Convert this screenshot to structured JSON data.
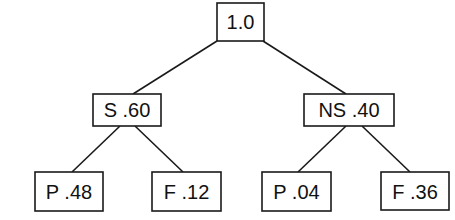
{
  "diagram": {
    "type": "probability-tree",
    "nodes": [
      {
        "id": "root",
        "label": "1.0"
      },
      {
        "id": "s",
        "label": "S .60"
      },
      {
        "id": "ns",
        "label": "NS .40"
      },
      {
        "id": "s-p",
        "label": "P .48"
      },
      {
        "id": "s-f",
        "label": "F .12"
      },
      {
        "id": "ns-p",
        "label": "P .04"
      },
      {
        "id": "ns-f",
        "label": "F .36"
      }
    ],
    "edges": [
      {
        "from": "root",
        "to": "s"
      },
      {
        "from": "root",
        "to": "ns"
      },
      {
        "from": "s",
        "to": "s-p"
      },
      {
        "from": "s",
        "to": "s-f"
      },
      {
        "from": "ns",
        "to": "ns-p"
      },
      {
        "from": "ns",
        "to": "ns-f"
      }
    ]
  }
}
